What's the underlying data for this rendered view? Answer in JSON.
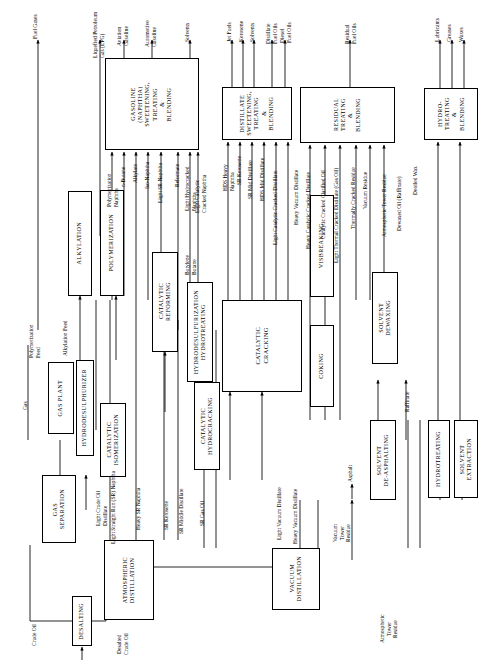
{
  "diagram": {
    "orientation": "rotated-90",
    "line_color": "#000000",
    "background": "#ffffff"
  },
  "inputs": [
    {
      "name": "crude-oil",
      "label": "Crude Oil"
    }
  ],
  "units": [
    {
      "id": "desalting",
      "label": "DESALTING"
    },
    {
      "id": "atmospheric-distillation",
      "label": "ATMOSPHERIC\nDISTILLATION"
    },
    {
      "id": "vacuum-distillation",
      "label": "VACUUM\nDISTILLATION"
    },
    {
      "id": "gas-separation",
      "label": "GAS\nSEPARATION"
    },
    {
      "id": "gas-plant",
      "label": "GAS PLANT"
    },
    {
      "id": "hydrodesulphurizer",
      "label": "HYDRODESULPHURIZER"
    },
    {
      "id": "catalytic-isomerization",
      "label": "CATALYTIC\nISOMERIZATION"
    },
    {
      "id": "polymerization",
      "label": "POLYMERIZATION"
    },
    {
      "id": "alkylation",
      "label": "ALKYLATION"
    },
    {
      "id": "catalytic-reforming",
      "label": "CATALYTIC\nREFORMING"
    },
    {
      "id": "hydrodesulfurization-hydrotreating",
      "label": "HYDRODESULFURIZATION\nHYDROTREATING"
    },
    {
      "id": "catalytic-hydrocracking",
      "label": "CATALYTIC\nHYDROCRACKING"
    },
    {
      "id": "catalytic-cracking",
      "label": "CATALYTIC\nCRACKING"
    },
    {
      "id": "coking",
      "label": "COKING"
    },
    {
      "id": "visbreaking",
      "label": "VISBREAKING"
    },
    {
      "id": "solvent-deasphalting",
      "label": "SOLVENT\nDE-ASPHALTING"
    },
    {
      "id": "solvent-dewaxing",
      "label": "SOLVENT\nDEWAXING"
    },
    {
      "id": "hydrotreating",
      "label": "HYDROTREATING"
    },
    {
      "id": "solvent-extraction",
      "label": "SOLVENT\nEXTRACTION"
    },
    {
      "id": "gasoline-blending",
      "label": "GASOLINE\n(NAPHTHA)\nSWEETENING,\nTREATING\n&\nBLENDING"
    },
    {
      "id": "distillate-blending",
      "label": "DISTILLATE\nSWEETENING,\nTREATING\n&\nBLENDING"
    },
    {
      "id": "residual-blending",
      "label": "RESIDUAL\nTREATING\n&\nBLENDING"
    },
    {
      "id": "hydrotreating-blending",
      "label": "HYDRO-\nTREATING\n&\nBLENDING"
    }
  ],
  "products": [
    {
      "id": "fuel-gases",
      "label": "Fuel Gases"
    },
    {
      "id": "lpg",
      "label": "Liquefied Petroleum\nGas (LPG)"
    },
    {
      "id": "aviation-gasoline",
      "label": "Aviation\nGasoline"
    },
    {
      "id": "automotive-gasoline",
      "label": "Automotive\nGasoline"
    },
    {
      "id": "solvents",
      "label": "Solvents"
    },
    {
      "id": "jet-fuels",
      "label": "Jet Fuels"
    },
    {
      "id": "kerosene",
      "label": "Kerosene"
    },
    {
      "id": "solvents-2",
      "label": "Solvents"
    },
    {
      "id": "distillate-fuel-oils",
      "label": "Distillate\nFuel Oils"
    },
    {
      "id": "diesel-fuel-oils",
      "label": "Diesel\nFuel Oils"
    },
    {
      "id": "residual-fuel-oils",
      "label": "Residual\nFuel Oils"
    },
    {
      "id": "lubricants",
      "label": "Lubricants"
    },
    {
      "id": "greases",
      "label": "Greases"
    },
    {
      "id": "waxes",
      "label": "Waxes"
    },
    {
      "id": "asphalt",
      "label": "Asphalt"
    }
  ],
  "streams": [
    {
      "id": "gas",
      "label": "Gas"
    },
    {
      "id": "polymerization-feed",
      "label": "Polymerization\nFeed"
    },
    {
      "id": "alkylation-feed",
      "label": "Alkylation Feed"
    },
    {
      "id": "polymerization-naphtha",
      "label": "Polymerization\nNaphtha"
    },
    {
      "id": "n-butane",
      "label": "n-Butane"
    },
    {
      "id": "alkylate",
      "label": "Alkylate"
    },
    {
      "id": "iso-naphtha",
      "label": "Iso-Naphtha"
    },
    {
      "id": "light-sr-naphtha",
      "label": "Light SR Naphtha"
    },
    {
      "id": "reformate",
      "label": "Reformate"
    },
    {
      "id": "light-hydrocracked-naphtha",
      "label": "Light Hydrocracked\nNaphtha"
    },
    {
      "id": "light-catalytic-cracked-naphtha",
      "label": "Light Catalytic\nCracked Naphtha"
    },
    {
      "id": "hds-heavy-naphtha",
      "label": "HDS Heavy\nNaphtha"
    },
    {
      "id": "sr-kerosene-top",
      "label": "SR Kerosene"
    },
    {
      "id": "sr-mid-distillate",
      "label": "SR Mid Distillate"
    },
    {
      "id": "hds-mid-distillate",
      "label": "HDS Mid Distillate"
    },
    {
      "id": "light-catalytic-cracked-distillate",
      "label": "Light Catalytic Cracked Distillate"
    },
    {
      "id": "heavy-vacuum-distillate-top",
      "label": "Heavy Vacuum Distillate"
    },
    {
      "id": "heavy-catalytic-cracked-distillate",
      "label": "Heavy Catalytic Cracked Distillate"
    },
    {
      "id": "catalytic-cracked-clarified-oil",
      "label": "Catalytic Cracked Clarified Oil"
    },
    {
      "id": "light-thermal-cracked-distillate",
      "label": "Light Thermal Cracked Distillate (Gas Oil)"
    },
    {
      "id": "thermally-cracked-residue",
      "label": "Thermally Cracked Residue"
    },
    {
      "id": "vacuum-residue",
      "label": "Vacuum Residue"
    },
    {
      "id": "atmospheric-tower-residue-right",
      "label": "Atmospheric Tower Residue"
    },
    {
      "id": "dewaxed-oil-raffinate",
      "label": "Dewaxed Oil (Raffinate)"
    },
    {
      "id": "deoiled-wax",
      "label": "Deoiled Wax"
    },
    {
      "id": "raffinate",
      "label": "Raffinate"
    },
    {
      "id": "butylene-butane",
      "label": "Butylene\nButane"
    },
    {
      "id": "light-crude-oil-distillate",
      "label": "Light Crude Oil\nDistillate"
    },
    {
      "id": "light-straight-run-naphtha",
      "label": "Light Straight Run (SR) Naphtha"
    },
    {
      "id": "heavy-sr-naphtha",
      "label": "Heavy SR Naphtha"
    },
    {
      "id": "sr-kerosene",
      "label": "SR Kerosene"
    },
    {
      "id": "sr-middle-distillate",
      "label": "SR Middle Distillate"
    },
    {
      "id": "sr-gas-oil",
      "label": "SR Gas Oil"
    },
    {
      "id": "light-vacuum-distillate",
      "label": "Light Vacuum Distillate"
    },
    {
      "id": "heavy-vacuum-distillate",
      "label": "Heavy Vacuum Distillate"
    },
    {
      "id": "vacuum-tower-residue",
      "label": "Vacuum\nTower\nResidue"
    },
    {
      "id": "atmospheric-tower-residue",
      "label": "Atmospheric\nTower\nResidue"
    },
    {
      "id": "desalted-crude-oil",
      "label": "Desalted\nCrude Oil"
    }
  ]
}
